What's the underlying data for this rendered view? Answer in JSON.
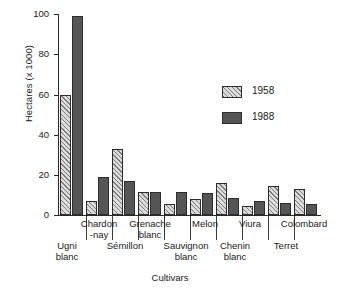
{
  "chart_data": {
    "type": "bar",
    "title": "",
    "xlabel": "Cultivars",
    "ylabel": "Hectares (x 1000)",
    "ylim": [
      0,
      104
    ],
    "yticks": [
      0,
      20,
      40,
      60,
      80,
      100
    ],
    "grid": false,
    "legend_position": "upper right",
    "categories": [
      "Ugni blanc",
      "Chardonnay",
      "Sémillon",
      "Grenache blanc",
      "Sauvignon blanc",
      "Melon",
      "Chenin blanc",
      "Viura",
      "Terret",
      "Colombard"
    ],
    "series": [
      {
        "name": "1958",
        "values": [
          62,
          7,
          34,
          12,
          5.5,
          8.5,
          16.5,
          4.5,
          15,
          13.5
        ]
      },
      {
        "name": "1988",
        "values": [
          103,
          19.5,
          17.5,
          12,
          12,
          11.5,
          9,
          7.5,
          6,
          5.5
        ]
      }
    ]
  },
  "axis": {
    "ylabel": "Hectares (x 1000)",
    "xlabel": "Cultivars",
    "ticklabels": [
      "100",
      "80",
      "60",
      "40",
      "20",
      "0"
    ]
  },
  "legend": {
    "items": [
      {
        "label": "1958",
        "swatch": "hatched-light"
      },
      {
        "label": "1988",
        "swatch": "solid-dark"
      }
    ]
  },
  "xcats": {
    "top": [
      {
        "line1": "Chardon",
        "line2": "-nay"
      },
      {
        "line1": "Grenache",
        "line2": "blanc"
      },
      {
        "line1": "Melon",
        "line2": ""
      },
      {
        "line1": "Viura",
        "line2": ""
      },
      {
        "line1": "Colombard",
        "line2": ""
      }
    ],
    "bottom": [
      {
        "line1": "Ugni",
        "line2": "blanc"
      },
      {
        "line1": "Sémillon",
        "line2": ""
      },
      {
        "line1": "Sauvignon",
        "line2": "blanc"
      },
      {
        "line1": "Chenin",
        "line2": "blanc"
      },
      {
        "line1": "Terret",
        "line2": ""
      }
    ]
  }
}
